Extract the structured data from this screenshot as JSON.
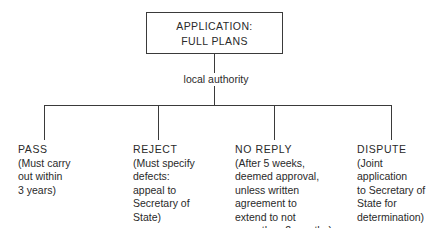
{
  "root": {
    "line1": "APPLICATION:",
    "line2": "FULL PLANS"
  },
  "connector_label": "local authority",
  "outcomes": [
    {
      "title": "PASS",
      "desc": "(Must carry\nout within\n3 years)"
    },
    {
      "title": "REJECT",
      "desc": "(Must specify\ndefects:\nappeal to\nSecretary of\nState)"
    },
    {
      "title": "NO REPLY",
      "desc": "(After 5 weeks,\ndeemed approval,\nunless written\nagreement to\nextend to not\nmore than 2 months)"
    },
    {
      "title": "DISPUTE",
      "desc": "(Joint\napplication\nto Secretary of\nState for\ndetermination)"
    }
  ]
}
